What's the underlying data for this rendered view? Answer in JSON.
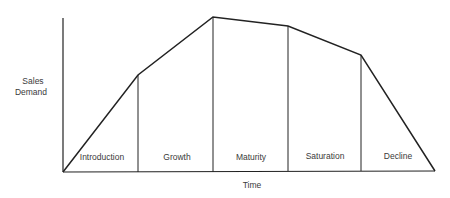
{
  "axes": {
    "y_label_line1": "Sales",
    "y_label_line2": "Demand",
    "x_label": "Time"
  },
  "stages": [
    {
      "label": "Introduction"
    },
    {
      "label": "Growth"
    },
    {
      "label": "Maturity"
    },
    {
      "label": "Saturation"
    },
    {
      "label": "Decline"
    }
  ],
  "colors": {
    "line": "#222222",
    "text": "#3a3a3a",
    "background": "#ffffff"
  }
}
